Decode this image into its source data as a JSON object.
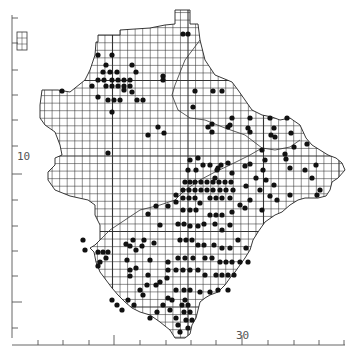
{
  "map": {
    "type": "grid distribution map",
    "grid": {
      "origin_x": 37,
      "origin_y": 5,
      "cell_px": 7.55,
      "line_color": "#333333",
      "major_every": 10
    },
    "axes": {
      "y_axis": {
        "x": 12,
        "top": 15,
        "bottom": 338,
        "ticks_y": [
          18,
          43,
          70,
          95,
          120,
          146,
          174,
          200,
          226,
          251,
          276,
          302,
          328
        ],
        "major_tick_y": [
          174,
          302
        ],
        "label": "10",
        "label_y": 160
      },
      "x_axis": {
        "y": 345,
        "left": 12,
        "right": 345,
        "ticks_x": [
          38,
          63,
          89,
          114,
          140,
          166,
          191,
          216,
          242,
          268,
          294,
          319,
          344
        ],
        "major_tick_x": [
          114,
          242
        ],
        "label": "30",
        "label_x": 238
      }
    },
    "inset": {
      "label": "island inset",
      "x": 17,
      "y": 32,
      "w": 10,
      "h": 18
    },
    "colors": {
      "dot": "#111111",
      "coast": "#222222",
      "boundary": "#333333",
      "background": "#ffffff"
    }
  },
  "labels": {
    "y_label": "10",
    "x_label": "30"
  }
}
